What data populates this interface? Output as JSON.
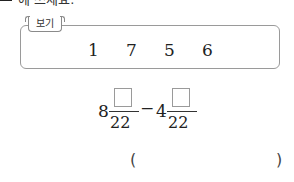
{
  "instruction": {
    "text": "에 쓰세요."
  },
  "bogi": {
    "label": "보기",
    "numbers": [
      "1",
      "7",
      "5",
      "6"
    ]
  },
  "expression": {
    "term1": {
      "whole": "8",
      "numerator": "",
      "denominator": "22"
    },
    "operator": "−",
    "term2": {
      "whole": "4",
      "numerator": "",
      "denominator": "22"
    }
  },
  "answer": {
    "open_paren": "(",
    "value": "",
    "close_paren": ")"
  }
}
